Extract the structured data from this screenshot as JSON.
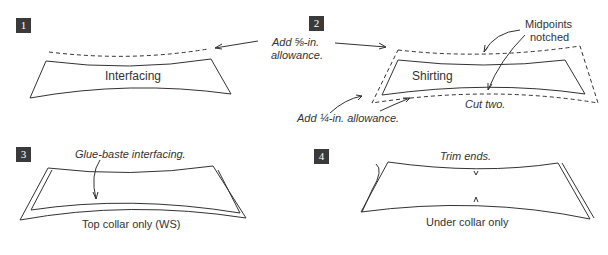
{
  "steps": [
    {
      "number": "1",
      "labels": {
        "piece": "Interfacing"
      }
    },
    {
      "number": "2",
      "labels": {
        "piece": "Shirting",
        "midpoints": "Midpoints",
        "midpoints2": "notched",
        "cut": "Cut two."
      }
    },
    {
      "number": "3",
      "labels": {
        "glue": "Glue-baste interfacing.",
        "caption": "Top collar only (WS)"
      }
    },
    {
      "number": "4",
      "labels": {
        "trim": "Trim ends.",
        "caption": "Under collar only"
      }
    }
  ],
  "annotations": {
    "add_large_line1": "Add ⅝-in.",
    "add_large_line2": "allowance.",
    "add_small": "Add ¼-in. allowance."
  },
  "colors": {
    "line": "#333333",
    "badge": "#3a3a3a"
  }
}
